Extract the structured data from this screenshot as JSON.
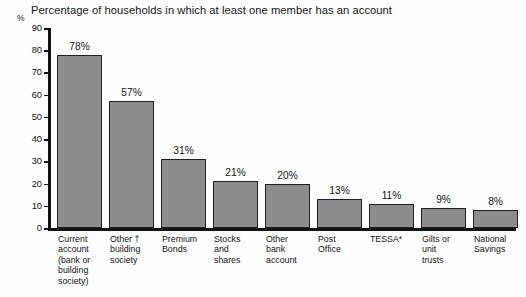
{
  "chart_data": {
    "type": "bar",
    "title": "Percentage of households in which at least one member has an account",
    "xlabel": "",
    "ylabel": "%",
    "ylim": [
      0,
      90
    ],
    "yticks": [
      0,
      10,
      20,
      30,
      40,
      50,
      60,
      70,
      80,
      90
    ],
    "grid": false,
    "legend": "none",
    "value_suffix": "%",
    "categories": [
      "Current account (bank or building society)",
      "Other † building society",
      "Premium Bonds",
      "Stocks and shares",
      "Other bank account",
      "Post Office",
      "TESSA*",
      "Gilts or unit trusts",
      "National Savings"
    ],
    "category_lines": [
      [
        "Current",
        "account",
        "(bank or",
        "building",
        "society)"
      ],
      [
        "Other †",
        "building",
        "society"
      ],
      [
        "Premium",
        "Bonds"
      ],
      [
        "Stocks",
        "and",
        "shares"
      ],
      [
        "Other",
        "bank",
        "account"
      ],
      [
        "Post",
        "Office"
      ],
      [
        "TESSA*"
      ],
      [
        "Gilts or",
        "unit",
        "trusts"
      ],
      [
        "National",
        "Savings"
      ]
    ],
    "values": [
      78,
      57,
      31,
      21,
      20,
      13,
      11,
      9,
      8
    ],
    "value_labels": [
      "78%",
      "57%",
      "31%",
      "21%",
      "20%",
      "13%",
      "11%",
      "9%",
      "8%"
    ],
    "bar_color": "#8d8d8d",
    "bar_edge_color": "#1f1f1f",
    "axis_color": "#111111",
    "background_color": "#fdfdfd"
  }
}
